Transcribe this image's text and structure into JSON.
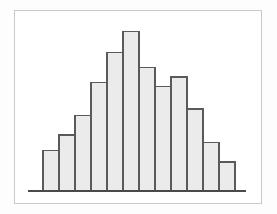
{
  "figure": {
    "kind": "histogram-figure",
    "background_color": "#fdfdfd",
    "frame": {
      "border_color": "#c9c9c9",
      "fill_color": "#ffffff",
      "x": 14,
      "y": 10,
      "width": 248,
      "height": 194
    }
  },
  "chart_data": {
    "type": "bar",
    "title": "",
    "subtitle": "",
    "xlabel": "",
    "ylabel": "",
    "grid": false,
    "legend": false,
    "legend_position": "none",
    "axis_visible": {
      "x": true,
      "y": false
    },
    "categories": [
      "1",
      "2",
      "3",
      "4",
      "5",
      "6",
      "7",
      "8",
      "9",
      "10",
      "11",
      "12"
    ],
    "values": [
      42,
      58,
      78,
      112,
      143,
      165,
      128,
      108,
      118,
      85,
      50,
      30
    ],
    "xlim": [
      0,
      12
    ],
    "ylim": [
      0,
      180
    ],
    "tick_labels": {
      "x": [],
      "y": []
    },
    "annotations": [],
    "bar_count": 12,
    "bar_gap": 0,
    "style": {
      "bar_fill": "#ebebeb",
      "bar_stroke": "#5a5a5a",
      "bar_stroke_width": 1.4,
      "baseline_color": "#4a4a4a",
      "baseline_width": 1.8
    },
    "geometry": {
      "baseline_y": 180,
      "baseline_x_start": 13,
      "baseline_x_end": 231,
      "bars_x_start": 28,
      "bar_width": 16
    }
  }
}
